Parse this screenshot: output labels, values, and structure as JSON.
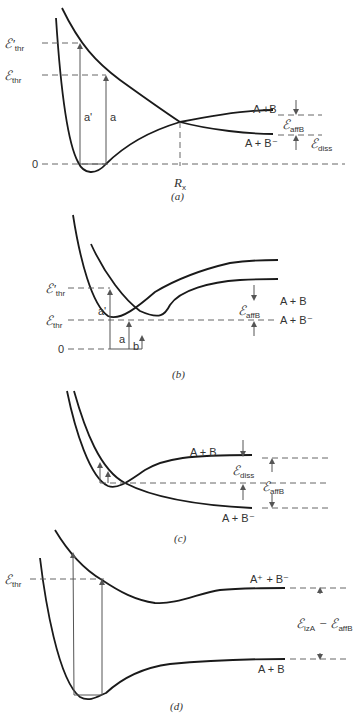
{
  "panels": [
    {
      "id": "a",
      "caption": "(a)",
      "levels": {
        "e_thr_prime": "ℰ'",
        "e_thr": "ℰ",
        "zero": "0",
        "thr_sub": "thr"
      },
      "transitions": [
        "a'",
        "a"
      ],
      "crossing": "R",
      "crossing_sub": "x",
      "asymptotes": {
        "upper": "A +B",
        "lower": "A + B⁻"
      },
      "energies": {
        "aff": "ℰ",
        "aff_sub": "affB",
        "diss": "ℰ",
        "diss_sub": "diss"
      }
    },
    {
      "id": "b",
      "caption": "(b)",
      "levels": {
        "e_thr_prime": "ℰ'",
        "e_thr": "ℰ",
        "zero": "0",
        "thr_sub": "thr"
      },
      "transitions": [
        "a'",
        "a",
        "b"
      ],
      "asymptotes": {
        "upper": "A + B",
        "lower": "A + B⁻"
      },
      "energies": {
        "aff": "ℰ",
        "aff_sub": "affB"
      }
    },
    {
      "id": "c",
      "caption": "(c)",
      "asymptotes": {
        "upper": "A + B",
        "lower": "A + B⁻"
      },
      "energies": {
        "diss": "ℰ",
        "diss_sub": "diss",
        "aff": "ℰ",
        "aff_sub": "affB"
      }
    },
    {
      "id": "d",
      "caption": "(d)",
      "levels": {
        "e_thr": "ℰ",
        "thr_sub": "thr"
      },
      "asymptotes": {
        "upper": "A⁺ + B⁻",
        "lower": "A + B"
      },
      "energies": {
        "diff": "ℰ",
        "diff_sub1": "izA",
        "minus": " − ",
        "diff2": "ℰ",
        "diff_sub2": "affB"
      }
    }
  ]
}
